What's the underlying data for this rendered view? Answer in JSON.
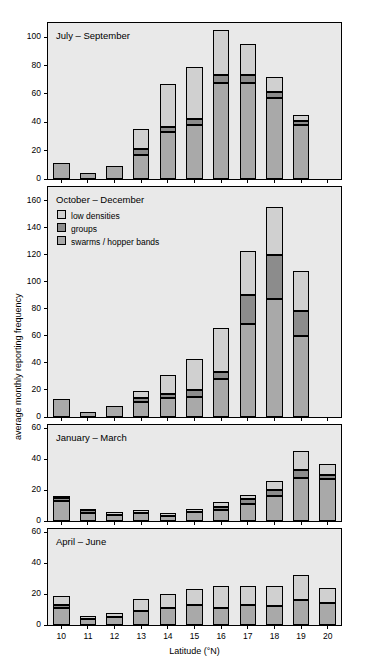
{
  "chart_data": {
    "type": "bar",
    "title": "",
    "xlabel": "Latitude (°N)",
    "ylabel": "average monthly reporting frequency",
    "categories": [
      "10",
      "11",
      "12",
      "13",
      "14",
      "15",
      "16",
      "17",
      "18",
      "19",
      "20"
    ],
    "legend": {
      "position": "inside-panel-2-top-left",
      "entries": [
        {
          "name": "low densities",
          "color": "#d0d0d0"
        },
        {
          "name": "groups",
          "color": "#8c8c8c"
        },
        {
          "name": "swarms / hopper bands",
          "color": "#a9a9a9"
        }
      ]
    },
    "panels": [
      {
        "title": "July – September",
        "ylim": [
          0,
          110
        ],
        "yticks": [
          0,
          20,
          40,
          60,
          80,
          100
        ],
        "series": [
          {
            "name": "swarms / hopper bands",
            "values": [
              0,
              0,
              0,
              0,
              0,
              0,
              0,
              0,
              0,
              0,
              0
            ]
          },
          {
            "name": "groups",
            "values": [
              0,
              0,
              0,
              3,
              4,
              4,
              4,
              5,
              4,
              4,
              3
            ]
          },
          {
            "name": "low densities",
            "values": [
              11,
              4,
              9,
              32,
              62,
              74,
              100,
              90,
              68,
              41,
              0
            ]
          }
        ],
        "stacks": [
          {
            "x": "10",
            "segments": [
              {
                "series": "swarms / hopper bands",
                "from": 0,
                "to": 11
              }
            ]
          },
          {
            "x": "11",
            "segments": [
              {
                "series": "swarms / hopper bands",
                "from": 0,
                "to": 4
              }
            ]
          },
          {
            "x": "12",
            "segments": [
              {
                "series": "swarms / hopper bands",
                "from": 0,
                "to": 9
              }
            ]
          },
          {
            "x": "13",
            "segments": [
              {
                "series": "swarms / hopper bands",
                "from": 0,
                "to": 17
              },
              {
                "series": "groups",
                "from": 17,
                "to": 21
              },
              {
                "series": "low densities",
                "from": 21,
                "to": 35
              }
            ]
          },
          {
            "x": "14",
            "segments": [
              {
                "series": "swarms / hopper bands",
                "from": 0,
                "to": 33
              },
              {
                "series": "groups",
                "from": 33,
                "to": 37
              },
              {
                "series": "low densities",
                "from": 37,
                "to": 67
              }
            ]
          },
          {
            "x": "15",
            "segments": [
              {
                "series": "swarms / hopper bands",
                "from": 0,
                "to": 38
              },
              {
                "series": "groups",
                "from": 38,
                "to": 42
              },
              {
                "series": "low densities",
                "from": 42,
                "to": 79
              }
            ]
          },
          {
            "x": "16",
            "segments": [
              {
                "series": "swarms / hopper bands",
                "from": 0,
                "to": 68
              },
              {
                "series": "groups",
                "from": 68,
                "to": 73
              },
              {
                "series": "low densities",
                "from": 73,
                "to": 105
              }
            ]
          },
          {
            "x": "17",
            "segments": [
              {
                "series": "swarms / hopper bands",
                "from": 0,
                "to": 68
              },
              {
                "series": "groups",
                "from": 68,
                "to": 73
              },
              {
                "series": "low densities",
                "from": 73,
                "to": 95
              }
            ]
          },
          {
            "x": "18",
            "segments": [
              {
                "series": "swarms / hopper bands",
                "from": 0,
                "to": 57
              },
              {
                "series": "groups",
                "from": 57,
                "to": 61
              },
              {
                "series": "low densities",
                "from": 61,
                "to": 72
              }
            ]
          },
          {
            "x": "19",
            "segments": [
              {
                "series": "swarms / hopper bands",
                "from": 0,
                "to": 38
              },
              {
                "series": "groups",
                "from": 38,
                "to": 41
              },
              {
                "series": "low densities",
                "from": 41,
                "to": 45
              }
            ]
          }
        ]
      },
      {
        "title": "October – December",
        "ylim": [
          0,
          170
        ],
        "yticks": [
          0,
          20,
          40,
          60,
          80,
          100,
          120,
          140,
          160
        ],
        "stacks": [
          {
            "x": "10",
            "segments": [
              {
                "series": "swarms / hopper bands",
                "from": 0,
                "to": 13
              }
            ]
          },
          {
            "x": "11",
            "segments": [
              {
                "series": "swarms / hopper bands",
                "from": 0,
                "to": 4
              }
            ]
          },
          {
            "x": "12",
            "segments": [
              {
                "series": "swarms / hopper bands",
                "from": 0,
                "to": 8
              }
            ]
          },
          {
            "x": "13",
            "segments": [
              {
                "series": "swarms / hopper bands",
                "from": 0,
                "to": 11
              },
              {
                "series": "groups",
                "from": 11,
                "to": 14
              },
              {
                "series": "low densities",
                "from": 14,
                "to": 19
              }
            ]
          },
          {
            "x": "14",
            "segments": [
              {
                "series": "swarms / hopper bands",
                "from": 0,
                "to": 14
              },
              {
                "series": "groups",
                "from": 14,
                "to": 17
              },
              {
                "series": "low densities",
                "from": 17,
                "to": 31
              }
            ]
          },
          {
            "x": "15",
            "segments": [
              {
                "series": "swarms / hopper bands",
                "from": 0,
                "to": 15
              },
              {
                "series": "groups",
                "from": 15,
                "to": 20
              },
              {
                "series": "low densities",
                "from": 20,
                "to": 43
              }
            ]
          },
          {
            "x": "16",
            "segments": [
              {
                "series": "swarms / hopper bands",
                "from": 0,
                "to": 28
              },
              {
                "series": "groups",
                "from": 28,
                "to": 33
              },
              {
                "series": "low densities",
                "from": 33,
                "to": 66
              }
            ]
          },
          {
            "x": "17",
            "segments": [
              {
                "series": "swarms / hopper bands",
                "from": 0,
                "to": 69
              },
              {
                "series": "groups",
                "from": 69,
                "to": 90
              },
              {
                "series": "low densities",
                "from": 90,
                "to": 123
              }
            ]
          },
          {
            "x": "18",
            "segments": [
              {
                "series": "swarms / hopper bands",
                "from": 0,
                "to": 87
              },
              {
                "series": "groups",
                "from": 87,
                "to": 120
              },
              {
                "series": "low densities",
                "from": 120,
                "to": 155
              }
            ]
          },
          {
            "x": "19",
            "segments": [
              {
                "series": "swarms / hopper bands",
                "from": 0,
                "to": 60
              },
              {
                "series": "groups",
                "from": 60,
                "to": 78
              },
              {
                "series": "low densities",
                "from": 78,
                "to": 108
              }
            ]
          }
        ]
      },
      {
        "title": "January – March",
        "ylim": [
          0,
          62
        ],
        "yticks": [
          0,
          20,
          40,
          60
        ],
        "stacks": [
          {
            "x": "10",
            "segments": [
              {
                "series": "swarms / hopper bands",
                "from": 0,
                "to": 13
              },
              {
                "series": "groups",
                "from": 13,
                "to": 15
              },
              {
                "series": "low densities",
                "from": 15,
                "to": 16
              }
            ]
          },
          {
            "x": "11",
            "segments": [
              {
                "series": "swarms / hopper bands",
                "from": 0,
                "to": 5
              },
              {
                "series": "groups",
                "from": 5,
                "to": 7
              },
              {
                "series": "low densities",
                "from": 7,
                "to": 8
              }
            ]
          },
          {
            "x": "12",
            "segments": [
              {
                "series": "swarms / hopper bands",
                "from": 0,
                "to": 4
              },
              {
                "series": "low densities",
                "from": 4,
                "to": 6
              }
            ]
          },
          {
            "x": "13",
            "segments": [
              {
                "series": "swarms / hopper bands",
                "from": 0,
                "to": 5
              },
              {
                "series": "low densities",
                "from": 5,
                "to": 7
              }
            ]
          },
          {
            "x": "14",
            "segments": [
              {
                "series": "swarms / hopper bands",
                "from": 0,
                "to": 3
              },
              {
                "series": "low densities",
                "from": 3,
                "to": 5
              }
            ]
          },
          {
            "x": "15",
            "segments": [
              {
                "series": "swarms / hopper bands",
                "from": 0,
                "to": 6
              },
              {
                "series": "low densities",
                "from": 6,
                "to": 8
              }
            ]
          },
          {
            "x": "16",
            "segments": [
              {
                "series": "swarms / hopper bands",
                "from": 0,
                "to": 7
              },
              {
                "series": "groups",
                "from": 7,
                "to": 9
              },
              {
                "series": "low densities",
                "from": 9,
                "to": 12
              }
            ]
          },
          {
            "x": "17",
            "segments": [
              {
                "series": "swarms / hopper bands",
                "from": 0,
                "to": 11
              },
              {
                "series": "groups",
                "from": 11,
                "to": 14
              },
              {
                "series": "low densities",
                "from": 14,
                "to": 17
              }
            ]
          },
          {
            "x": "18",
            "segments": [
              {
                "series": "swarms / hopper bands",
                "from": 0,
                "to": 16
              },
              {
                "series": "groups",
                "from": 16,
                "to": 20
              },
              {
                "series": "low densities",
                "from": 20,
                "to": 26
              }
            ]
          },
          {
            "x": "19",
            "segments": [
              {
                "series": "swarms / hopper bands",
                "from": 0,
                "to": 28
              },
              {
                "series": "groups",
                "from": 28,
                "to": 33
              },
              {
                "series": "low densities",
                "from": 33,
                "to": 45
              }
            ]
          },
          {
            "x": "20",
            "segments": [
              {
                "series": "swarms / hopper bands",
                "from": 0,
                "to": 27
              },
              {
                "series": "groups",
                "from": 27,
                "to": 30
              },
              {
                "series": "low densities",
                "from": 30,
                "to": 37
              }
            ]
          }
        ]
      },
      {
        "title": "April – June",
        "ylim": [
          0,
          62
        ],
        "yticks": [
          0,
          20,
          40,
          60
        ],
        "stacks": [
          {
            "x": "10",
            "segments": [
              {
                "series": "swarms / hopper bands",
                "from": 0,
                "to": 11
              },
              {
                "series": "groups",
                "from": 11,
                "to": 13
              },
              {
                "series": "low densities",
                "from": 13,
                "to": 19
              }
            ]
          },
          {
            "x": "11",
            "segments": [
              {
                "series": "swarms / hopper bands",
                "from": 0,
                "to": 4
              },
              {
                "series": "low densities",
                "from": 4,
                "to": 6
              }
            ]
          },
          {
            "x": "12",
            "segments": [
              {
                "series": "swarms / hopper bands",
                "from": 0,
                "to": 5
              },
              {
                "series": "low densities",
                "from": 5,
                "to": 8
              }
            ]
          },
          {
            "x": "13",
            "segments": [
              {
                "series": "swarms / hopper bands",
                "from": 0,
                "to": 9
              },
              {
                "series": "low densities",
                "from": 9,
                "to": 17
              }
            ]
          },
          {
            "x": "14",
            "segments": [
              {
                "series": "swarms / hopper bands",
                "from": 0,
                "to": 11
              },
              {
                "series": "low densities",
                "from": 11,
                "to": 20
              }
            ]
          },
          {
            "x": "15",
            "segments": [
              {
                "series": "swarms / hopper bands",
                "from": 0,
                "to": 13
              },
              {
                "series": "low densities",
                "from": 13,
                "to": 23
              }
            ]
          },
          {
            "x": "16",
            "segments": [
              {
                "series": "swarms / hopper bands",
                "from": 0,
                "to": 11
              },
              {
                "series": "low densities",
                "from": 11,
                "to": 25
              }
            ]
          },
          {
            "x": "17",
            "segments": [
              {
                "series": "swarms / hopper bands",
                "from": 0,
                "to": 13
              },
              {
                "series": "low densities",
                "from": 13,
                "to": 25
              }
            ]
          },
          {
            "x": "18",
            "segments": [
              {
                "series": "swarms / hopper bands",
                "from": 0,
                "to": 12
              },
              {
                "series": "low densities",
                "from": 12,
                "to": 25
              }
            ]
          },
          {
            "x": "19",
            "segments": [
              {
                "series": "swarms / hopper bands",
                "from": 0,
                "to": 16
              },
              {
                "series": "low densities",
                "from": 16,
                "to": 32
              }
            ]
          },
          {
            "x": "20",
            "segments": [
              {
                "series": "swarms / hopper bands",
                "from": 0,
                "to": 14
              },
              {
                "series": "low densities",
                "from": 14,
                "to": 24
              }
            ]
          }
        ]
      }
    ]
  }
}
